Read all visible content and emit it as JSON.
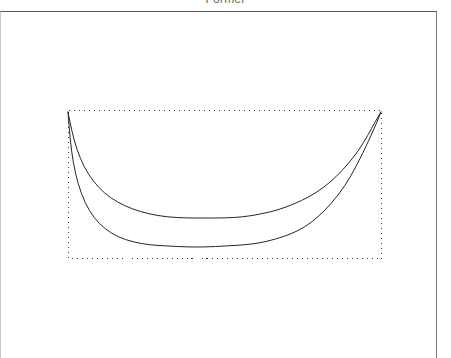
{
  "window": {
    "title": "Former"
  },
  "frame": {
    "name": "outer-border"
  },
  "chart_data": {
    "type": "line",
    "title": "Former",
    "xlabel": "",
    "ylabel": "",
    "grid": false,
    "legend": null,
    "xlim": [
      0,
      1
    ],
    "ylim": [
      0,
      1
    ],
    "bounding_box": {
      "label": "dotted-bounding-box",
      "x0": 68,
      "y0": 110,
      "x1": 381,
      "y1": 258,
      "style": "dotted",
      "color": "#3a3a3a"
    },
    "series": [
      {
        "name": "upper-curve",
        "color": "#262626",
        "points": [
          [
            68,
            112
          ],
          [
            72,
            132
          ],
          [
            77,
            150
          ],
          [
            84,
            167
          ],
          [
            93,
            181
          ],
          [
            104,
            193
          ],
          [
            117,
            202
          ],
          [
            132,
            209
          ],
          [
            149,
            214
          ],
          [
            167,
            217
          ],
          [
            186,
            218
          ],
          [
            205,
            218
          ],
          [
            224,
            218
          ],
          [
            243,
            217
          ],
          [
            261,
            214
          ],
          [
            278,
            210
          ],
          [
            294,
            204
          ],
          [
            309,
            197
          ],
          [
            323,
            188
          ],
          [
            336,
            177
          ],
          [
            348,
            164
          ],
          [
            359,
            150
          ],
          [
            368,
            135
          ],
          [
            375,
            122
          ],
          [
            381,
            112
          ]
        ]
      },
      {
        "name": "lower-curve",
        "color": "#262626",
        "points": [
          [
            68,
            112
          ],
          [
            70,
            138
          ],
          [
            73,
            162
          ],
          [
            78,
            184
          ],
          [
            85,
            203
          ],
          [
            94,
            218
          ],
          [
            105,
            229
          ],
          [
            118,
            237
          ],
          [
            133,
            242
          ],
          [
            150,
            245
          ],
          [
            168,
            246
          ],
          [
            187,
            247
          ],
          [
            206,
            247
          ],
          [
            225,
            246
          ],
          [
            243,
            245
          ],
          [
            260,
            243
          ],
          [
            276,
            239
          ],
          [
            291,
            234
          ],
          [
            305,
            227
          ],
          [
            318,
            217
          ],
          [
            331,
            204
          ],
          [
            345,
            186
          ],
          [
            357,
            165
          ],
          [
            369,
            140
          ],
          [
            377,
            122
          ],
          [
            381,
            112
          ]
        ]
      }
    ]
  },
  "colors": {
    "curve": "#262626",
    "bbox": "#3a3a3a",
    "frame_top": "#5a5a5a",
    "frame_right": "#7d7d7d",
    "title_text": "#6b6b6b",
    "background": "#ffffff"
  }
}
